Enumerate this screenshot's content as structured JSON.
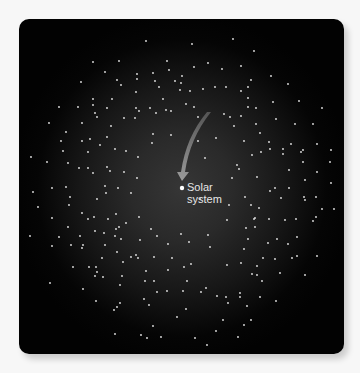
{
  "figure": {
    "label_line1": "Solar",
    "label_line2": "system",
    "colors": {
      "page_background": "#f7f7f7",
      "panel_edge": "#050505",
      "panel_glow": "#363636",
      "star": "#e8e8e8",
      "arrow": "#8a8a8a",
      "label": "#e6e6e6"
    },
    "solar_system_marker": {
      "x": 182,
      "y": 188
    },
    "arrow": {
      "start": {
        "x": 210,
        "y": 112
      },
      "end": {
        "x": 182,
        "y": 181
      }
    },
    "stars": [
      [
        93,
        62
      ],
      [
        119,
        61
      ],
      [
        105,
        72
      ],
      [
        81,
        82
      ],
      [
        117,
        80
      ],
      [
        121,
        85
      ],
      [
        93,
        99
      ],
      [
        59,
        107
      ],
      [
        78,
        107
      ],
      [
        93,
        105
      ],
      [
        95,
        113
      ],
      [
        107,
        108
      ],
      [
        97,
        117
      ],
      [
        49,
        123
      ],
      [
        82,
        123
      ],
      [
        111,
        126
      ],
      [
        124,
        118
      ],
      [
        112,
        99
      ],
      [
        146,
        41
      ],
      [
        192,
        44
      ],
      [
        233,
        39
      ],
      [
        167,
        61
      ],
      [
        169,
        70
      ],
      [
        194,
        67
      ],
      [
        208,
        63
      ],
      [
        222,
        69
      ],
      [
        137,
        74
      ],
      [
        153,
        73
      ],
      [
        137,
        79
      ],
      [
        155,
        81
      ],
      [
        175,
        81
      ],
      [
        182,
        76
      ],
      [
        181,
        83
      ],
      [
        159,
        87
      ],
      [
        136,
        92
      ],
      [
        180,
        90
      ],
      [
        190,
        91
      ],
      [
        203,
        89
      ],
      [
        215,
        87
      ],
      [
        226,
        87
      ],
      [
        163,
        99
      ],
      [
        136,
        108
      ],
      [
        139,
        111
      ],
      [
        150,
        108
      ],
      [
        156,
        113
      ],
      [
        166,
        110
      ],
      [
        171,
        111
      ],
      [
        186,
        104
      ],
      [
        194,
        107
      ],
      [
        198,
        117
      ],
      [
        135,
        118
      ],
      [
        224,
        114
      ],
      [
        234,
        126
      ],
      [
        230,
        117
      ],
      [
        241,
        116
      ],
      [
        254,
        51
      ],
      [
        241,
        66
      ],
      [
        251,
        80
      ],
      [
        271,
        76
      ],
      [
        288,
        84
      ],
      [
        241,
        91
      ],
      [
        248,
        87
      ],
      [
        248,
        98
      ],
      [
        248,
        107
      ],
      [
        256,
        108
      ],
      [
        273,
        102
      ],
      [
        299,
        101
      ],
      [
        276,
        119
      ],
      [
        295,
        124
      ],
      [
        256,
        124
      ],
      [
        313,
        124
      ],
      [
        322,
        108
      ],
      [
        66,
        132
      ],
      [
        61,
        141
      ],
      [
        63,
        151
      ],
      [
        31,
        157
      ],
      [
        47,
        162
      ],
      [
        68,
        163
      ],
      [
        82,
        141
      ],
      [
        90,
        139
      ],
      [
        100,
        145
      ],
      [
        107,
        137
      ],
      [
        115,
        149
      ],
      [
        126,
        151
      ],
      [
        88,
        152
      ],
      [
        88,
        168
      ],
      [
        79,
        168
      ],
      [
        93,
        173
      ],
      [
        107,
        167
      ],
      [
        110,
        171
      ],
      [
        124,
        172
      ],
      [
        118,
        188
      ],
      [
        106,
        193
      ],
      [
        105,
        186
      ],
      [
        52,
        188
      ],
      [
        66,
        187
      ],
      [
        33,
        192
      ],
      [
        97,
        199
      ],
      [
        70,
        197
      ],
      [
        69,
        205
      ],
      [
        38,
        207
      ],
      [
        52,
        218
      ],
      [
        82,
        213
      ],
      [
        88,
        219
      ],
      [
        94,
        217
      ],
      [
        108,
        219
      ],
      [
        116,
        214
      ],
      [
        126,
        223
      ],
      [
        119,
        227
      ],
      [
        95,
        231
      ],
      [
        104,
        233
      ],
      [
        115,
        236
      ],
      [
        68,
        227
      ],
      [
        30,
        236
      ],
      [
        59,
        237
      ],
      [
        80,
        236
      ],
      [
        116,
        229
      ],
      [
        121,
        239
      ],
      [
        171,
        135
      ],
      [
        153,
        134
      ],
      [
        152,
        143
      ],
      [
        138,
        157
      ],
      [
        137,
        178
      ],
      [
        198,
        141
      ],
      [
        216,
        138
      ],
      [
        205,
        158
      ],
      [
        237,
        165
      ],
      [
        232,
        178
      ],
      [
        131,
        193
      ],
      [
        200,
        199
      ],
      [
        229,
        205
      ],
      [
        139,
        217
      ],
      [
        227,
        220
      ],
      [
        151,
        229
      ],
      [
        181,
        234
      ],
      [
        208,
        235
      ],
      [
        157,
        236
      ],
      [
        260,
        133
      ],
      [
        244,
        141
      ],
      [
        269,
        142
      ],
      [
        291,
        144
      ],
      [
        270,
        149
      ],
      [
        283,
        149
      ],
      [
        317,
        144
      ],
      [
        301,
        152
      ],
      [
        252,
        155
      ],
      [
        261,
        152
      ],
      [
        283,
        154
      ],
      [
        303,
        150
      ],
      [
        331,
        150
      ],
      [
        289,
        170
      ],
      [
        239,
        169
      ],
      [
        303,
        162
      ],
      [
        330,
        162
      ],
      [
        257,
        177
      ],
      [
        317,
        172
      ],
      [
        305,
        180
      ],
      [
        331,
        183
      ],
      [
        289,
        188
      ],
      [
        275,
        188
      ],
      [
        270,
        191
      ],
      [
        316,
        197
      ],
      [
        281,
        198
      ],
      [
        245,
        197
      ],
      [
        304,
        197
      ],
      [
        251,
        205
      ],
      [
        259,
        208
      ],
      [
        305,
        200
      ],
      [
        322,
        209
      ],
      [
        255,
        218
      ],
      [
        334,
        209
      ],
      [
        246,
        228
      ],
      [
        254,
        219
      ],
      [
        269,
        219
      ],
      [
        285,
        220
      ],
      [
        296,
        219
      ],
      [
        316,
        217
      ],
      [
        313,
        221
      ],
      [
        248,
        239
      ],
      [
        277,
        239
      ],
      [
        297,
        237
      ],
      [
        255,
        227
      ],
      [
        83,
        245
      ],
      [
        71,
        245
      ],
      [
        52,
        246
      ],
      [
        82,
        248
      ],
      [
        105,
        245
      ],
      [
        117,
        252
      ],
      [
        102,
        258
      ],
      [
        73,
        267
      ],
      [
        89,
        267
      ],
      [
        96,
        267
      ],
      [
        97,
        272
      ],
      [
        95,
        276
      ],
      [
        103,
        277
      ],
      [
        123,
        262
      ],
      [
        122,
        276
      ],
      [
        120,
        285
      ],
      [
        50,
        283
      ],
      [
        83,
        289
      ],
      [
        96,
        301
      ],
      [
        120,
        303
      ],
      [
        114,
        310
      ],
      [
        117,
        307
      ],
      [
        115,
        334
      ],
      [
        140,
        240
      ],
      [
        168,
        244
      ],
      [
        189,
        242
      ],
      [
        210,
        247
      ],
      [
        136,
        255
      ],
      [
        131,
        257
      ],
      [
        154,
        257
      ],
      [
        138,
        258
      ],
      [
        172,
        258
      ],
      [
        146,
        271
      ],
      [
        168,
        270
      ],
      [
        191,
        264
      ],
      [
        184,
        267
      ],
      [
        227,
        265
      ],
      [
        257,
        266
      ],
      [
        145,
        281
      ],
      [
        154,
        281
      ],
      [
        187,
        281
      ],
      [
        157,
        292
      ],
      [
        167,
        291
      ],
      [
        183,
        291
      ],
      [
        206,
        288
      ],
      [
        217,
        296
      ],
      [
        201,
        292
      ],
      [
        228,
        303
      ],
      [
        144,
        299
      ],
      [
        226,
        297
      ],
      [
        240,
        297
      ],
      [
        186,
        309
      ],
      [
        247,
        306
      ],
      [
        149,
        305
      ],
      [
        223,
        320
      ],
      [
        177,
        317
      ],
      [
        153,
        326
      ],
      [
        216,
        331
      ],
      [
        161,
        337
      ],
      [
        141,
        335
      ],
      [
        195,
        338
      ],
      [
        147,
        338
      ],
      [
        238,
        337
      ],
      [
        207,
        345
      ],
      [
        268,
        243
      ],
      [
        288,
        244
      ],
      [
        244,
        249
      ],
      [
        263,
        258
      ],
      [
        275,
        259
      ],
      [
        292,
        258
      ],
      [
        297,
        256
      ],
      [
        317,
        256
      ],
      [
        241,
        263
      ],
      [
        252,
        274
      ],
      [
        257,
        275
      ],
      [
        280,
        273
      ],
      [
        305,
        275
      ],
      [
        262,
        281
      ],
      [
        240,
        293
      ],
      [
        260,
        297
      ],
      [
        276,
        301
      ],
      [
        251,
        320
      ],
      [
        244,
        325
      ]
    ]
  }
}
